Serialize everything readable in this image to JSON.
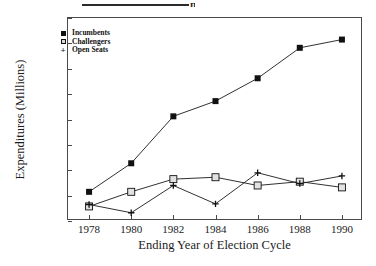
{
  "figure": {
    "cropped_header_fragment": "п",
    "ylabel": "Expenditures (Millions)",
    "xlabel": "Ending Year of Election Cycle"
  },
  "legend": {
    "items": [
      {
        "label": "Incumbents",
        "marker": "filled-square",
        "color": "#111111"
      },
      {
        "label": "Challengers",
        "marker": "open-square",
        "color": "#111111"
      },
      {
        "label": "Open Seats",
        "marker": "plus",
        "color": "#111111"
      }
    ]
  },
  "chart_data": {
    "type": "line",
    "title": "",
    "xlabel": "Ending Year of Election Cycle",
    "ylabel": "Expenditures (Millions)",
    "x": [
      1978,
      1980,
      1982,
      1984,
      1986,
      1988,
      1990
    ],
    "xtick_labels": [
      "1978",
      "1980",
      "1982",
      "1984",
      "1986",
      "1988",
      "1990"
    ],
    "ytick_labels": [
      "20",
      "40",
      "60",
      "80",
      "100",
      "120",
      "140",
      "160",
      "180"
    ],
    "yticks": [
      20,
      40,
      60,
      80,
      100,
      120,
      140,
      160,
      180
    ],
    "xlim": [
      1977,
      1991
    ],
    "ylim": [
      20,
      180
    ],
    "grid": false,
    "legend_position": "top-left",
    "series": [
      {
        "name": "Incumbents",
        "marker": "filled-square",
        "values": [
          43,
          65.5,
          102.5,
          114.5,
          132.5,
          156.5,
          163
        ]
      },
      {
        "name": "Challengers",
        "marker": "open-square",
        "values": [
          31.5,
          43,
          53,
          54.5,
          48,
          51,
          46.5
        ]
      },
      {
        "name": "Open Seats",
        "marker": "plus",
        "values": [
          33,
          26.5,
          48,
          33.5,
          58,
          49.5,
          55.5
        ]
      }
    ]
  }
}
